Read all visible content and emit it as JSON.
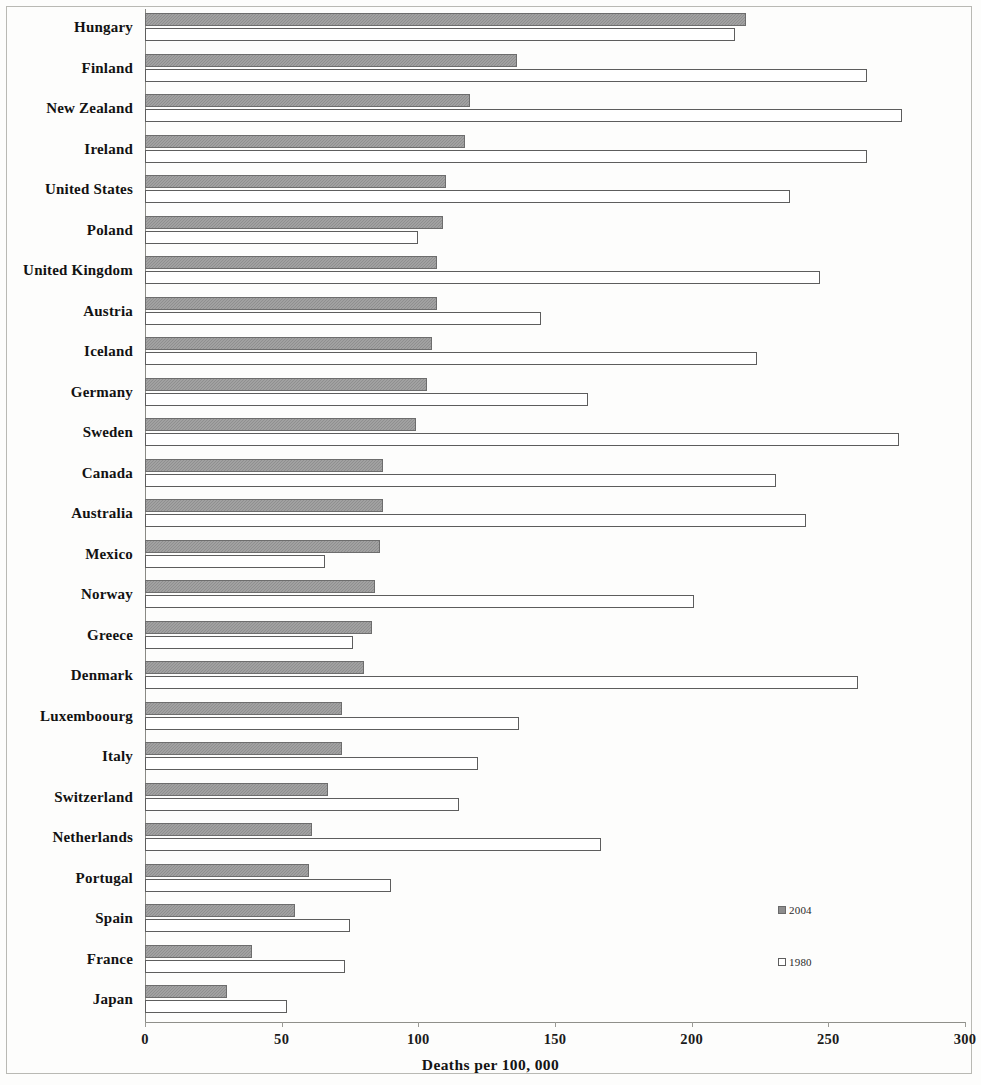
{
  "chart_data": {
    "type": "bar",
    "orientation": "horizontal",
    "title": "",
    "xlabel": "Deaths per 100, 000",
    "ylabel": "",
    "xlim": [
      0,
      300
    ],
    "xticks": [
      0,
      50,
      100,
      150,
      200,
      250,
      300
    ],
    "grid": false,
    "legend_position": "inside-right",
    "categories": [
      "Hungary",
      "Finland",
      "New Zealand",
      "Ireland",
      "United States",
      "Poland",
      "United Kingdom",
      "Austria",
      "Iceland",
      "Germany",
      "Sweden",
      "Canada",
      "Australia",
      "Mexico",
      "Norway",
      "Greece",
      "Denmark",
      "Luxemboourg",
      "Italy",
      "Switzerland",
      "Netherlands",
      "Portugal",
      "Spain",
      "France",
      "Japan"
    ],
    "series": [
      {
        "name": "2004",
        "color": "#8f8f8f",
        "values": [
          220,
          136,
          119,
          117,
          110,
          109,
          107,
          107,
          105,
          103,
          99,
          87,
          87,
          86,
          84,
          83,
          80,
          72,
          72,
          67,
          61,
          60,
          55,
          39,
          30
        ]
      },
      {
        "name": "1980",
        "color": "#ffffff",
        "values": [
          216,
          264,
          277,
          264,
          236,
          100,
          247,
          145,
          224,
          162,
          276,
          231,
          242,
          66,
          201,
          76,
          261,
          137,
          122,
          115,
          167,
          90,
          75,
          73,
          52
        ]
      }
    ]
  },
  "legend": {
    "items": [
      {
        "label": "2004",
        "swatch": "filled-gray-square"
      },
      {
        "label": "1980",
        "swatch": "empty-white-square"
      }
    ]
  }
}
